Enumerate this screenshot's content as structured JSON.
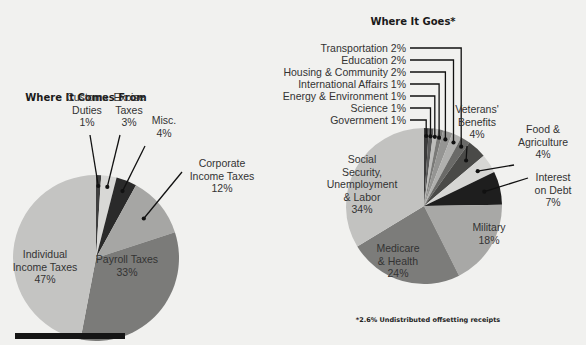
{
  "chart_data": [
    {
      "type": "pie",
      "title": "Where It Comes From",
      "unit": "%",
      "start": "12 o'clock",
      "direction": "clockwise",
      "slices": [
        {
          "label": "Customs Duties",
          "lines": [
            "Customs",
            "Duties",
            "1%"
          ],
          "value": 1,
          "color": "#3e3e3e",
          "label_position": "outside"
        },
        {
          "label": "Excise Taxes",
          "lines": [
            "Excise",
            "Taxes",
            "3%"
          ],
          "value": 3,
          "color": "#d8d8d6",
          "label_position": "outside"
        },
        {
          "label": "Misc.",
          "lines": [
            "Misc.",
            "4%"
          ],
          "value": 4,
          "color": "#2a2a2a",
          "label_position": "outside"
        },
        {
          "label": "Corporate Income Taxes",
          "lines": [
            "Corporate",
            "Income Taxes",
            "12%"
          ],
          "value": 12,
          "color": "#a6a6a4",
          "label_position": "outside"
        },
        {
          "label": "Payroll Taxes",
          "lines": [
            "Payroll Taxes",
            "33%"
          ],
          "value": 33,
          "color": "#7b7b79",
          "label_position": "inside"
        },
        {
          "label": "Individual Income Taxes",
          "lines": [
            "Individual",
            "Income Taxes",
            "47%"
          ],
          "value": 47,
          "color": "#c4c4c2",
          "label_position": "inside"
        }
      ]
    },
    {
      "type": "pie",
      "title": "Where It Goes*",
      "unit": "%",
      "start": "12 o'clock",
      "direction": "clockwise",
      "footnote": "*2.6% Undistributed offsetting receipts",
      "slices": [
        {
          "label": "Government",
          "lines": [
            "Government 1%"
          ],
          "value": 1,
          "color": "#3a3a3a",
          "label_position": "legend"
        },
        {
          "label": "Science",
          "lines": [
            "Science 1%"
          ],
          "value": 1,
          "color": "#5a5a5a",
          "label_position": "legend"
        },
        {
          "label": "Energy & Environment",
          "lines": [
            "Energy & Environment 1%"
          ],
          "value": 1,
          "color": "#bdbdbb",
          "label_position": "legend"
        },
        {
          "label": "International Affairs",
          "lines": [
            "International Affairs 1%"
          ],
          "value": 1,
          "color": "#7a7a78",
          "label_position": "legend"
        },
        {
          "label": "Housing & Community",
          "lines": [
            "Housing & Community 2%"
          ],
          "value": 2,
          "color": "#959593",
          "label_position": "legend"
        },
        {
          "label": "Education",
          "lines": [
            "Education 2%"
          ],
          "value": 2,
          "color": "#b0b0ae",
          "label_position": "legend"
        },
        {
          "label": "Transportation",
          "lines": [
            "Transportation 2%"
          ],
          "value": 2,
          "color": "#6a6a68",
          "label_position": "legend"
        },
        {
          "label": "Veterans' Benefits",
          "lines": [
            "Veterans'",
            "Benefits",
            "4%"
          ],
          "value": 4,
          "color": "#4a4a48",
          "label_position": "outside"
        },
        {
          "label": "Food & Agriculture",
          "lines": [
            "Food &",
            "Agriculture",
            "4%"
          ],
          "value": 4,
          "color": "#d6d6d4",
          "label_position": "outside"
        },
        {
          "label": "Interest on Debt",
          "lines": [
            "Interest",
            "on Debt",
            "7%"
          ],
          "value": 7,
          "color": "#1e1e1e",
          "label_position": "outside"
        },
        {
          "label": "Military",
          "lines": [
            "Military",
            "18%"
          ],
          "value": 18,
          "color": "#a8a8a6",
          "label_position": "inside"
        },
        {
          "label": "Medicare & Health",
          "lines": [
            "Medicare",
            "& Health",
            "24%"
          ],
          "value": 24,
          "color": "#7c7c7a",
          "label_position": "inside"
        },
        {
          "label": "Social Security, Unemployment & Labor",
          "lines": [
            "Social",
            "Security,",
            "Unemployment",
            "& Labor",
            "34%"
          ],
          "value": 34,
          "color": "#c2c2c0",
          "label_position": "inside"
        }
      ]
    }
  ]
}
